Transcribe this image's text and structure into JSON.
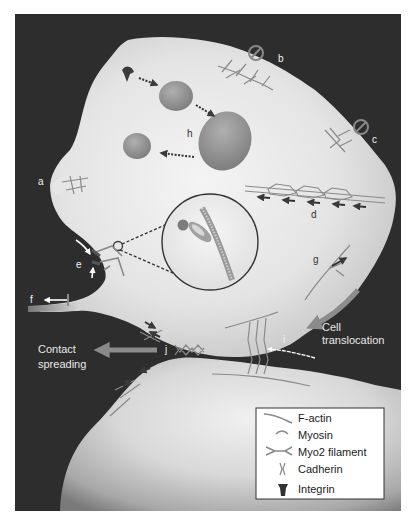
{
  "figure": {
    "background_color": "#2b2b2b",
    "cell_color": "#ececec",
    "accent_gray": "#8c8c8c"
  },
  "labels": {
    "a": "a",
    "b": "b",
    "c": "c",
    "d": "d",
    "e": "e",
    "f": "f",
    "g": "g",
    "h": "h",
    "i": "i",
    "j": "j"
  },
  "annotations": {
    "cell_translocation_line1": "Cell",
    "cell_translocation_line2": "translocation",
    "contact_spreading_line1": "Contact",
    "contact_spreading_line2": "spreading"
  },
  "legend": {
    "items": [
      {
        "label": "F-actin",
        "icon": "f-actin-icon"
      },
      {
        "label": "Myosin",
        "icon": "myosin-icon"
      },
      {
        "label": "Myo2 filament",
        "icon": "myo2-filament-icon"
      },
      {
        "label": "Cadherin",
        "icon": "cadherin-icon"
      },
      {
        "label": "Integrin",
        "icon": "integrin-icon"
      }
    ]
  }
}
